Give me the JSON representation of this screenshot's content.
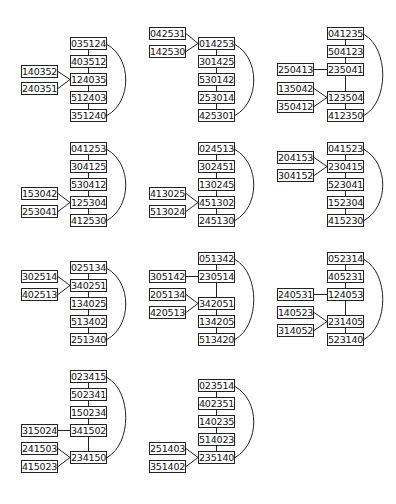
{
  "diagrams": [
    {
      "id": 1,
      "main": [
        {
          "label": "035124",
          "x": 70,
          "y": 37
        },
        {
          "label": "403512",
          "x": 70,
          "y": 55
        },
        {
          "label": "124035",
          "x": 70,
          "y": 73
        },
        {
          "label": "512403",
          "x": 70,
          "y": 91
        },
        {
          "label": "351240",
          "x": 70,
          "y": 109
        }
      ],
      "side": [
        {
          "label": "140352",
          "x": 21,
          "y": 65,
          "target": 2
        },
        {
          "label": "240351",
          "x": 21,
          "y": 82,
          "target": 2
        }
      ],
      "arc": {
        "from": 0,
        "to": 4,
        "bulge": 126
      }
    },
    {
      "id": 2,
      "main": [
        {
          "label": "014253",
          "x": 198,
          "y": 37
        },
        {
          "label": "301425",
          "x": 198,
          "y": 55
        },
        {
          "label": "530142",
          "x": 198,
          "y": 73
        },
        {
          "label": "253014",
          "x": 198,
          "y": 91
        },
        {
          "label": "425301",
          "x": 198,
          "y": 109
        }
      ],
      "side": [
        {
          "label": "042531",
          "x": 149,
          "y": 27,
          "target": 0
        },
        {
          "label": "142530",
          "x": 149,
          "y": 45,
          "target": 0
        }
      ],
      "arc": {
        "from": 0,
        "to": 4,
        "bulge": 254
      }
    },
    {
      "id": 3,
      "main": [
        {
          "label": "041235",
          "x": 327,
          "y": 27
        },
        {
          "label": "504123",
          "x": 327,
          "y": 45
        },
        {
          "label": "235041",
          "x": 327,
          "y": 63
        },
        {
          "label": "123504",
          "x": 327,
          "y": 91
        },
        {
          "label": "412350",
          "x": 327,
          "y": 109
        }
      ],
      "side": [
        {
          "label": "250413",
          "x": 277,
          "y": 63,
          "target": 2,
          "straight": true
        },
        {
          "label": "135042",
          "x": 277,
          "y": 82,
          "target": 3
        },
        {
          "label": "350412",
          "x": 277,
          "y": 100,
          "target": 3
        }
      ],
      "arc": {
        "from": 0,
        "to": 4,
        "bulge": 383
      }
    },
    {
      "id": 4,
      "main": [
        {
          "label": "041253",
          "x": 70,
          "y": 142
        },
        {
          "label": "304125",
          "x": 70,
          "y": 160
        },
        {
          "label": "530412",
          "x": 70,
          "y": 178
        },
        {
          "label": "125304",
          "x": 70,
          "y": 196
        },
        {
          "label": "412530",
          "x": 70,
          "y": 214
        }
      ],
      "side": [
        {
          "label": "153042",
          "x": 21,
          "y": 187,
          "target": 3
        },
        {
          "label": "253041",
          "x": 21,
          "y": 205,
          "target": 3
        }
      ],
      "arc": {
        "from": 0,
        "to": 4,
        "bulge": 126
      }
    },
    {
      "id": 5,
      "main": [
        {
          "label": "024513",
          "x": 198,
          "y": 142
        },
        {
          "label": "302451",
          "x": 198,
          "y": 160
        },
        {
          "label": "130245",
          "x": 198,
          "y": 178
        },
        {
          "label": "451302",
          "x": 198,
          "y": 196
        },
        {
          "label": "245130",
          "x": 198,
          "y": 214
        }
      ],
      "side": [
        {
          "label": "413025",
          "x": 149,
          "y": 187,
          "target": 3
        },
        {
          "label": "513024",
          "x": 149,
          "y": 205,
          "target": 3
        }
      ],
      "arc": {
        "from": 0,
        "to": 4,
        "bulge": 254
      }
    },
    {
      "id": 6,
      "main": [
        {
          "label": "041523",
          "x": 327,
          "y": 142
        },
        {
          "label": "230415",
          "x": 327,
          "y": 160
        },
        {
          "label": "523041",
          "x": 327,
          "y": 178
        },
        {
          "label": "152304",
          "x": 327,
          "y": 196
        },
        {
          "label": "415230",
          "x": 327,
          "y": 214
        }
      ],
      "side": [
        {
          "label": "204153",
          "x": 277,
          "y": 151,
          "target": 1
        },
        {
          "label": "304152",
          "x": 277,
          "y": 169,
          "target": 1
        }
      ],
      "arc": {
        "from": 0,
        "to": 4,
        "bulge": 383
      }
    },
    {
      "id": 7,
      "main": [
        {
          "label": "025134",
          "x": 70,
          "y": 261
        },
        {
          "label": "340251",
          "x": 70,
          "y": 279
        },
        {
          "label": "134025",
          "x": 70,
          "y": 297
        },
        {
          "label": "513402",
          "x": 70,
          "y": 315
        },
        {
          "label": "251340",
          "x": 70,
          "y": 333
        }
      ],
      "side": [
        {
          "label": "302514",
          "x": 21,
          "y": 270,
          "target": 1
        },
        {
          "label": "402513",
          "x": 21,
          "y": 288,
          "target": 1
        }
      ],
      "arc": {
        "from": 0,
        "to": 4,
        "bulge": 126
      }
    },
    {
      "id": 8,
      "main": [
        {
          "label": "051342",
          "x": 198,
          "y": 252
        },
        {
          "label": "230514",
          "x": 198,
          "y": 270
        },
        {
          "label": "342051",
          "x": 198,
          "y": 297
        },
        {
          "label": "134205",
          "x": 198,
          "y": 315
        },
        {
          "label": "513420",
          "x": 198,
          "y": 333
        }
      ],
      "side": [
        {
          "label": "305142",
          "x": 149,
          "y": 270,
          "target": 1,
          "straight": true
        },
        {
          "label": "205134",
          "x": 149,
          "y": 288,
          "target": 2
        },
        {
          "label": "420513",
          "x": 149,
          "y": 306,
          "target": 2
        }
      ],
      "arc": {
        "from": 0,
        "to": 4,
        "bulge": 254
      }
    },
    {
      "id": 9,
      "main": [
        {
          "label": "052314",
          "x": 327,
          "y": 252
        },
        {
          "label": "405231",
          "x": 327,
          "y": 270
        },
        {
          "label": "124053",
          "x": 327,
          "y": 288
        },
        {
          "label": "231405",
          "x": 327,
          "y": 315
        },
        {
          "label": "523140",
          "x": 327,
          "y": 333
        }
      ],
      "side": [
        {
          "label": "240531",
          "x": 277,
          "y": 288,
          "target": 2,
          "straight": true
        },
        {
          "label": "140523",
          "x": 277,
          "y": 306,
          "target": 3
        },
        {
          "label": "314052",
          "x": 277,
          "y": 324,
          "target": 3
        }
      ],
      "arc": {
        "from": 0,
        "to": 4,
        "bulge": 383
      }
    },
    {
      "id": 10,
      "main": [
        {
          "label": "023415",
          "x": 70,
          "y": 370
        },
        {
          "label": "502341",
          "x": 70,
          "y": 388
        },
        {
          "label": "150234",
          "x": 70,
          "y": 406
        },
        {
          "label": "341502",
          "x": 70,
          "y": 424
        },
        {
          "label": "234150",
          "x": 70,
          "y": 451
        }
      ],
      "side": [
        {
          "label": "315024",
          "x": 21,
          "y": 424,
          "target": 3,
          "straight": true
        },
        {
          "label": "241503",
          "x": 21,
          "y": 442,
          "target": 4
        },
        {
          "label": "415023",
          "x": 21,
          "y": 460,
          "target": 4
        }
      ],
      "arc": {
        "from": 0,
        "to": 4,
        "bulge": 126
      }
    },
    {
      "id": 11,
      "main": [
        {
          "label": "023514",
          "x": 198,
          "y": 379
        },
        {
          "label": "402351",
          "x": 198,
          "y": 397
        },
        {
          "label": "140235",
          "x": 198,
          "y": 415
        },
        {
          "label": "514023",
          "x": 198,
          "y": 433
        },
        {
          "label": "235140",
          "x": 198,
          "y": 451
        }
      ],
      "side": [
        {
          "label": "251403",
          "x": 149,
          "y": 442,
          "target": 4
        },
        {
          "label": "351402",
          "x": 149,
          "y": 460,
          "target": 4
        }
      ],
      "arc": {
        "from": 0,
        "to": 4,
        "bulge": 254
      }
    }
  ]
}
